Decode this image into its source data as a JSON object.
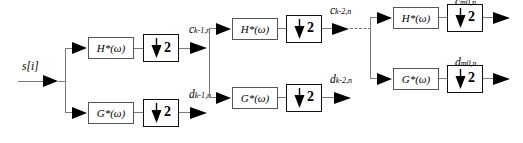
{
  "diagram": {
    "input_label": "s[i]",
    "filters": {
      "highpass": "H*(ω)",
      "lowpass": "G*(ω)",
      "highpass_base": "H",
      "lowpass_base": "G",
      "star": "*",
      "omega": "(ω)"
    },
    "downsample": {
      "factor": "2",
      "icon": "down-arrow-icon"
    },
    "stage1": {
      "approx_label_base": "c",
      "approx_label_sub": "k-1,n",
      "detail_label_base": "d",
      "detail_label_sub": "k-1,n",
      "filter_top": "H*(ω)",
      "filter_bottom": "G*(ω)",
      "down_top": "2",
      "down_bottom": "2"
    },
    "stage2": {
      "approx_label_base": "c",
      "approx_label_sub": "k-2,n",
      "detail_label_base": "d",
      "detail_label_sub": "k-2,n",
      "filter_top": "H*(ω)",
      "filter_bottom": "G*(ω)",
      "down_top": "2",
      "down_bottom": "2"
    },
    "stage3": {
      "approx_label_base": "c",
      "approx_label_sub": "m0,n",
      "detail_label_base": "d",
      "detail_label_sub": "m0,n",
      "filter_top": "H*(ω)",
      "filter_bottom": "G*(ω)",
      "down_top": "2",
      "down_bottom": "2"
    },
    "colors": {
      "wire": "#7a7a7a",
      "filter_border": "#555555",
      "downsample_border": "#111111",
      "text": "#000000",
      "background": "#ffffff"
    },
    "continuation": "dashed-connector"
  }
}
